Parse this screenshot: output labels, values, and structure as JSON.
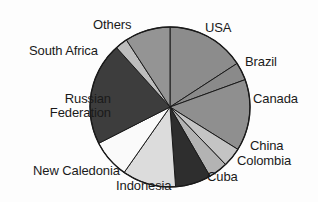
{
  "chart_data": {
    "type": "pie",
    "title": "",
    "subtitle": "",
    "xlabel": "",
    "ylabel": "",
    "legend_position": "none",
    "labels_position": "outside",
    "grid": false,
    "center": {
      "x": 170,
      "y": 107
    },
    "radius": 80,
    "start_angle_deg": 0,
    "direction": "clockwise",
    "categories": [
      "USA",
      "Brazil",
      "Canada",
      "China",
      "Colombia",
      "Cuba",
      "Indonesia",
      "New Caledonia",
      "Russian Federation",
      "South Africa",
      "Others"
    ],
    "values": [
      15.8,
      3.6,
      14.4,
      3.9,
      3.9,
      7.2,
      10.8,
      7.8,
      20.8,
      2.5,
      9.3
    ],
    "angles_deg": [
      57.0,
      13.0,
      52.0,
      14.0,
      14.0,
      26.0,
      39.0,
      28.0,
      75.0,
      9.0,
      33.0
    ],
    "slices": [
      {
        "label": "USA",
        "value": 15.8,
        "start_deg": 0,
        "end_deg": 57,
        "color": "#8c8c8c"
      },
      {
        "label": "Brazil",
        "value": 3.6,
        "start_deg": 57,
        "end_deg": 70,
        "color": "#8a8a8a"
      },
      {
        "label": "Canada",
        "value": 14.4,
        "start_deg": 70,
        "end_deg": 122,
        "color": "#8f8f8f"
      },
      {
        "label": "China",
        "value": 3.9,
        "start_deg": 122,
        "end_deg": 136,
        "color": "#c4c4c4"
      },
      {
        "label": "Colombia",
        "value": 3.9,
        "start_deg": 136,
        "end_deg": 150,
        "color": "#b3b3b3"
      },
      {
        "label": "Cuba",
        "value": 7.2,
        "start_deg": 150,
        "end_deg": 176,
        "color": "#2e2e2e"
      },
      {
        "label": "Indonesia",
        "value": 10.8,
        "start_deg": 176,
        "end_deg": 215,
        "color": "#dcdcdc"
      },
      {
        "label": "New Caledonia",
        "value": 7.8,
        "start_deg": 215,
        "end_deg": 243,
        "color": "#fafafa"
      },
      {
        "label": "Russian Federation",
        "value": 20.8,
        "start_deg": 243,
        "end_deg": 318,
        "color": "#3d3d3d"
      },
      {
        "label": "South Africa",
        "value": 2.5,
        "start_deg": 318,
        "end_deg": 327,
        "color": "#bdbdbd"
      },
      {
        "label": "Others",
        "value": 9.3,
        "start_deg": 327,
        "end_deg": 360,
        "color": "#949494"
      }
    ]
  },
  "labels": {
    "others": "Others",
    "usa": "USA",
    "south_africa": "South Africa",
    "brazil": "Brazil",
    "canada": "Canada",
    "russian_federation": "Russian\nFederation",
    "russian_federation_line1": "Russian",
    "russian_federation_line2": "Federation",
    "china": "China",
    "colombia": "Colombia",
    "new_caledonia": "New Caledonia",
    "cuba": "Cuba",
    "indonesia": "Indonesia"
  },
  "style": {
    "background": "#fdfdfd",
    "outline": "#1a1a1a",
    "text": "#1a1a1a"
  }
}
